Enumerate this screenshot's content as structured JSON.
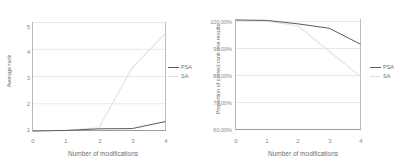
{
  "figure": {
    "background": "#ffffff",
    "series_colors": {
      "PSA": "#5b5b5b",
      "SA": "#e2e2e2"
    },
    "axis_color": "#b9b9b9",
    "grid_color": "#e8e8e8",
    "tick_text_color": "#8a8a8a",
    "label_text_color": "#6f6f6f"
  },
  "chart_data": [
    {
      "type": "line",
      "id": "average-rank",
      "title": "",
      "xlabel": "Number of modifications",
      "ylabel": "Average rank",
      "x": [
        0,
        1,
        2,
        3,
        4
      ],
      "xlim": [
        0,
        4
      ],
      "ylim": [
        1,
        5
      ],
      "xticks": [
        "0",
        "1",
        "2",
        "3",
        "4"
      ],
      "yticks": [
        "1",
        "2",
        "3",
        "4",
        "5"
      ],
      "grid": "horizontal",
      "legend_position": "right",
      "series": [
        {
          "name": "PSA",
          "color": "#5b5b5b",
          "values": [
            1.0,
            1.02,
            1.08,
            1.09,
            1.35
          ]
        },
        {
          "name": "SA",
          "color": "#e2e2e2",
          "values": [
            1.0,
            1.03,
            1.12,
            3.35,
            4.62
          ]
        }
      ]
    },
    {
      "type": "line",
      "id": "proportion-correct-rank-one",
      "title": "",
      "xlabel": "Number of modifications",
      "ylabel": "Proportion of correct rank one results",
      "x": [
        0,
        1,
        2,
        3,
        4
      ],
      "xlim": [
        0,
        4
      ],
      "ylim": [
        60,
        100
      ],
      "xticks": [
        "0",
        "1",
        "2",
        "3",
        "4"
      ],
      "yticks": [
        "60.00%",
        "70.00%",
        "80.00%",
        "90.00%",
        "100.00%"
      ],
      "grid": "horizontal",
      "legend_position": "right",
      "series": [
        {
          "name": "PSA",
          "color": "#5b5b5b",
          "values": [
            100.0,
            99.85,
            98.6,
            97.0,
            91.2
          ]
        },
        {
          "name": "SA",
          "color": "#e2e2e2",
          "values": [
            100.0,
            99.6,
            97.9,
            88.6,
            79.5
          ]
        }
      ]
    }
  ],
  "legend": {
    "entries": [
      {
        "label": "PSA",
        "color": "#5b5b5b"
      },
      {
        "label": "SA",
        "color": "#e2e2e2"
      }
    ]
  }
}
